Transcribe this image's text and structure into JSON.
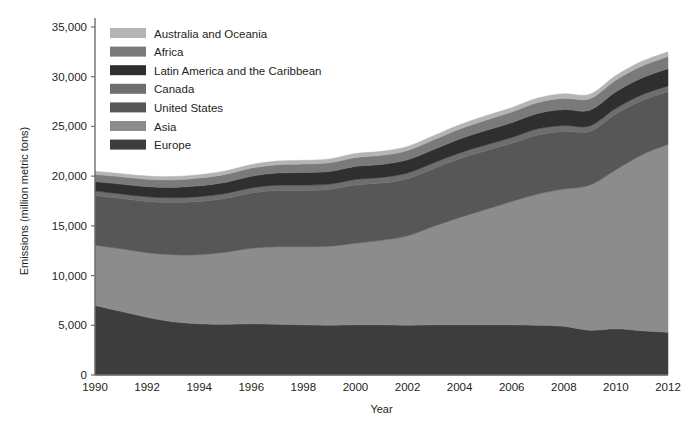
{
  "chart_data": {
    "type": "area",
    "stacked": true,
    "title": "",
    "xlabel": "Year",
    "ylabel": "Emissions (million metric tons)",
    "xlim": [
      1990,
      2012
    ],
    "ylim": [
      0,
      35000
    ],
    "ytick_labels": [
      "0",
      "5,000",
      "10,000",
      "15,000",
      "20,000",
      "25,000",
      "30,000",
      "35,000"
    ],
    "ytick_values": [
      0,
      5000,
      10000,
      15000,
      20000,
      25000,
      30000,
      35000
    ],
    "xtick_labels": [
      "1990",
      "1992",
      "1994",
      "1996",
      "1998",
      "2000",
      "2002",
      "2004",
      "2006",
      "2008",
      "2010",
      "2012"
    ],
    "xtick_values": [
      1990,
      1992,
      1994,
      1996,
      1998,
      2000,
      2002,
      2004,
      2006,
      2008,
      2010,
      2012
    ],
    "grid": false,
    "legend_position": "top-left",
    "x": [
      1990,
      1991,
      1992,
      1993,
      1994,
      1995,
      1996,
      1997,
      1998,
      1999,
      2000,
      2001,
      2002,
      2003,
      2004,
      2005,
      2006,
      2007,
      2008,
      2009,
      2010,
      2011,
      2012
    ],
    "stack_order_bottom_to_top": [
      "Europe",
      "Asia",
      "United States",
      "Canada",
      "Latin America and the Caribbean",
      "Africa",
      "Australia and Oceania"
    ],
    "series": [
      {
        "name": "Europe",
        "color": "#3d3d3d",
        "values": [
          7000,
          6400,
          5800,
          5350,
          5150,
          5100,
          5150,
          5100,
          5050,
          5000,
          5050,
          5050,
          5000,
          5050,
          5050,
          5050,
          5050,
          5000,
          4900,
          4500,
          4650,
          4450,
          4300
        ]
      },
      {
        "name": "Asia",
        "color": "#8c8c8c",
        "values": [
          6050,
          6300,
          6500,
          6750,
          6950,
          7250,
          7600,
          7800,
          7850,
          7950,
          8200,
          8500,
          9000,
          9900,
          10800,
          11600,
          12400,
          13200,
          13800,
          14600,
          16000,
          17700,
          18900
        ]
      },
      {
        "name": "United States",
        "color": "#575757",
        "values": [
          5000,
          5050,
          5150,
          5250,
          5350,
          5400,
          5550,
          5650,
          5650,
          5700,
          5850,
          5750,
          5750,
          5800,
          5900,
          5900,
          5850,
          5950,
          5800,
          5400,
          5600,
          5450,
          5300
        ]
      },
      {
        "name": "Canada",
        "color": "#6e6e6e",
        "values": [
          450,
          460,
          470,
          470,
          490,
          500,
          520,
          540,
          545,
          550,
          570,
          565,
          570,
          585,
          590,
          590,
          590,
          605,
          595,
          555,
          570,
          575,
          570
        ]
      },
      {
        "name": "Latin America and the Caribbean",
        "color": "#2f2f2f",
        "values": [
          950,
          990,
          1020,
          1050,
          1090,
          1120,
          1170,
          1220,
          1260,
          1270,
          1310,
          1310,
          1320,
          1340,
          1400,
          1450,
          1490,
          1550,
          1600,
          1580,
          1660,
          1700,
          1740
        ]
      },
      {
        "name": "Africa",
        "color": "#7a7a7a",
        "values": [
          730,
          740,
          750,
          760,
          780,
          800,
          820,
          840,
          860,
          870,
          900,
          920,
          940,
          980,
          1010,
          1040,
          1070,
          1100,
          1130,
          1150,
          1180,
          1200,
          1230
        ]
      },
      {
        "name": "Australia and Oceania",
        "color": "#b4b4b4",
        "values": [
          300,
          310,
          320,
          325,
          335,
          345,
          355,
          365,
          375,
          385,
          395,
          400,
          405,
          415,
          425,
          435,
          440,
          450,
          460,
          455,
          465,
          470,
          475
        ]
      }
    ],
    "legend_entries": [
      {
        "label": "Australia and Oceania",
        "color": "#b4b4b4"
      },
      {
        "label": "Africa",
        "color": "#7a7a7a"
      },
      {
        "label": "Latin America and the Caribbean",
        "color": "#2f2f2f"
      },
      {
        "label": "Canada",
        "color": "#6e6e6e"
      },
      {
        "label": "United States",
        "color": "#575757"
      },
      {
        "label": "Asia",
        "color": "#8c8c8c"
      },
      {
        "label": "Europe",
        "color": "#3d3d3d"
      }
    ],
    "axis_color": "#6f6f6f",
    "text_color": "#231f20"
  }
}
